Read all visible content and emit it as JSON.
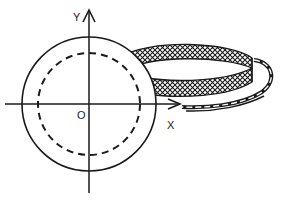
{
  "diagram": {
    "axes": {
      "x_label": "X",
      "y_label": "Y",
      "origin_label": "O"
    },
    "elements": [
      {
        "name": "outer-circle",
        "style": "solid"
      },
      {
        "name": "inner-circle",
        "style": "dashed"
      },
      {
        "name": "hatched-band",
        "style": "crosshatch ring strip"
      },
      {
        "name": "band-tail",
        "style": "strip curving back toward x-axis"
      }
    ],
    "colors": {
      "ink": "#1a1a1a",
      "background": "#ffffff"
    }
  }
}
